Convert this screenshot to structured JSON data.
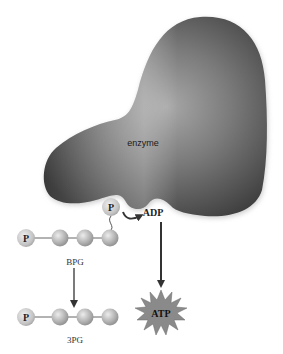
{
  "diagram": {
    "labels": {
      "enzyme": "enzyme",
      "phosphate": "P",
      "adp": "ADP",
      "atp": "ATP",
      "substrate": "BPG",
      "product": "3PG"
    },
    "colors": {
      "enzyme_dark": "#3a3a3a",
      "enzyme_light": "#9a9a9a",
      "ball_fill": "#b8b8b8",
      "ball_highlight": "#e6e6e6",
      "phosphate_fill": "#c8c8c8",
      "arrow": "#333333",
      "atp_burst": "#8a8a8a",
      "background": "#ffffff"
    },
    "nodes": {
      "bpg_chain": [
        "P",
        "C",
        "C",
        "C"
      ],
      "pg3_chain": [
        "P",
        "C",
        "C",
        "C"
      ]
    }
  }
}
